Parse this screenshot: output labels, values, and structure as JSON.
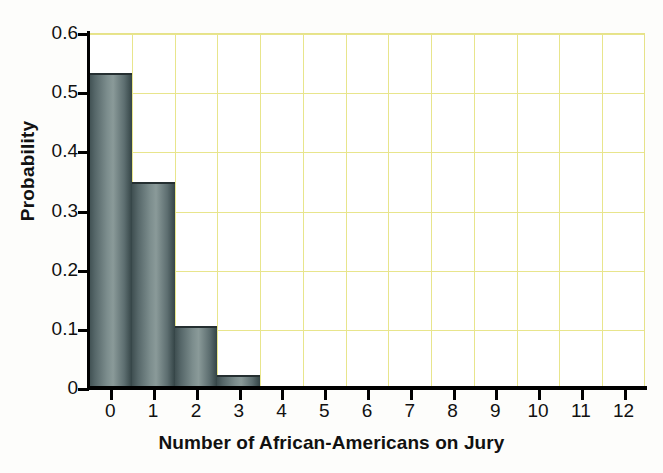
{
  "chart_data": {
    "type": "bar",
    "title": "",
    "xlabel": "Number of African-Americans on Jury",
    "ylabel": "Probability",
    "categories": [
      "0",
      "1",
      "2",
      "3",
      "4",
      "5",
      "6",
      "7",
      "8",
      "9",
      "10",
      "11",
      "12"
    ],
    "values": [
      0.533,
      0.348,
      0.105,
      0.022,
      0.003,
      0.0,
      0.0,
      0.0,
      0.0,
      0.0,
      0.0,
      0.0,
      0.0
    ],
    "xlim": [
      -0.5,
      12.5
    ],
    "ylim": [
      0,
      0.6
    ],
    "y_ticks": [
      0,
      0.1,
      0.2,
      0.3,
      0.4,
      0.5,
      0.6
    ],
    "y_tick_labels": [
      "0",
      "0.1",
      "0.2",
      "0.3",
      "0.4",
      "0.5",
      "0.6"
    ],
    "x_ticks": [
      0,
      1,
      2,
      3,
      4,
      5,
      6,
      7,
      8,
      9,
      10,
      11,
      12
    ],
    "x_tick_labels": [
      "0",
      "1",
      "2",
      "3",
      "4",
      "5",
      "6",
      "7",
      "8",
      "9",
      "10",
      "11",
      "12"
    ],
    "grid": true,
    "grid_color": "#e8e58c",
    "bar_color": "#6b7c7d",
    "bar_edge_color": "#252f31",
    "axis_color": "#000000",
    "background_color": "#ffffff",
    "legend": null,
    "legend_position": "none"
  }
}
